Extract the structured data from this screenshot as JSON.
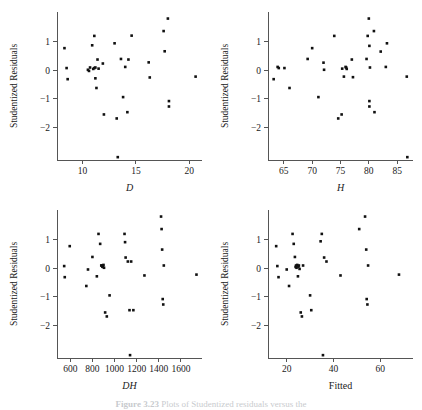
{
  "figure": {
    "width": 422,
    "height": 410,
    "background": "#ffffff",
    "point_color": "#111111",
    "axis_color": "#555555",
    "caption_label": "Figure 3.23",
    "caption_text": "Plots of Studentized residuals versus the"
  },
  "panels": [
    {
      "id": "panel-d",
      "xlabel": "D",
      "xlabel_style": "italic",
      "ylabel": "Studentized Residuals",
      "xticks": [
        10,
        15,
        20
      ],
      "yticks": [
        1,
        0,
        -1,
        -2
      ],
      "ytick_labels": [
        "1",
        "0",
        "−1",
        "−2"
      ],
      "xlim": [
        7.6,
        21.2
      ],
      "ylim": [
        -3.15,
        2.05
      ]
    },
    {
      "id": "panel-h",
      "xlabel": "H",
      "xlabel_style": "italic",
      "ylabel": "Studentized Residuals",
      "xticks": [
        65,
        70,
        75,
        80,
        85
      ],
      "yticks": [
        1,
        0,
        -1,
        -2
      ],
      "ytick_labels": [
        "1",
        "0",
        "−1",
        "−2"
      ],
      "xlim": [
        62.2,
        87.8
      ],
      "ylim": [
        -3.15,
        2.05
      ]
    },
    {
      "id": "panel-dh",
      "xlabel": "DH",
      "xlabel_style": "italic",
      "ylabel": "Studentized Residuals",
      "xticks": [
        600,
        800,
        1000,
        1200,
        1400,
        1600
      ],
      "yticks": [
        1,
        0,
        -1,
        -2
      ],
      "ytick_labels": [
        "1",
        "0",
        "−1",
        "−2"
      ],
      "xlim": [
        480,
        1790
      ],
      "ylim": [
        -3.15,
        2.05
      ]
    },
    {
      "id": "panel-fitted",
      "xlabel": "Fitted",
      "xlabel_style": "normal",
      "ylabel": "Studentized Residuals",
      "xticks": [
        20,
        40,
        60
      ],
      "yticks": [
        1,
        0,
        -1,
        -2
      ],
      "ytick_labels": [
        "1",
        "0",
        "−1",
        "−2"
      ],
      "xlim": [
        12,
        74
      ],
      "ylim": [
        -3.15,
        2.05
      ]
    }
  ],
  "chart_data": [
    {
      "type": "scatter",
      "title": "",
      "xlabel": "D",
      "ylabel": "Studentized Residuals",
      "xlim": [
        7.6,
        21.2
      ],
      "ylim": [
        -3.15,
        2.05
      ],
      "grid": false,
      "legend": "none",
      "x": [
        8.3,
        8.5,
        8.6,
        10.5,
        10.6,
        10.7,
        10.9,
        11.0,
        11.1,
        11.1,
        11.2,
        11.2,
        11.3,
        11.4,
        11.5,
        11.9,
        12.0,
        13.0,
        13.2,
        13.3,
        13.6,
        13.8,
        14.0,
        14.2,
        14.3,
        14.6,
        16.2,
        16.3,
        17.6,
        17.7,
        18.0,
        18.1,
        18.1,
        20.6
      ],
      "y": [
        0.78,
        0.08,
        -0.31,
        0.02,
        -0.02,
        0.1,
        0.88,
        0.05,
        1.21,
        0.08,
        0.1,
        -0.28,
        -0.62,
        0.38,
        0.06,
        0.24,
        -1.55,
        0.95,
        -1.69,
        -3.05,
        0.4,
        -0.94,
        0.12,
        -1.47,
        0.38,
        1.22,
        0.28,
        -0.25,
        1.38,
        0.67,
        1.82,
        -1.08,
        -1.27,
        -0.22
      ]
    },
    {
      "type": "scatter",
      "title": "",
      "xlabel": "H",
      "ylabel": "Studentized Residuals",
      "xlim": [
        62.2,
        87.8
      ],
      "ylim": [
        -3.15,
        2.05
      ],
      "grid": false,
      "legend": "none",
      "x": [
        63.2,
        63.9,
        64.1,
        65.1,
        66.0,
        69.2,
        70.0,
        71.1,
        72.0,
        72.1,
        73.9,
        74.6,
        75.2,
        75.3,
        75.6,
        75.9,
        76.0,
        76.1,
        77.0,
        77.2,
        79.6,
        79.8,
        80.0,
        80.1,
        80.1,
        80.1,
        80.2,
        80.9,
        81.0,
        82.1,
        83.0,
        83.2,
        86.7,
        86.8
      ],
      "y": [
        -0.31,
        0.12,
        0.08,
        0.08,
        -0.62,
        0.4,
        0.78,
        -0.94,
        0.27,
        0.02,
        1.21,
        -1.69,
        -1.55,
        0.06,
        -0.22,
        0.12,
        0.1,
        0.05,
        0.38,
        -0.24,
        0.4,
        1.21,
        1.82,
        0.86,
        -1.08,
        -1.27,
        0.1,
        1.38,
        -1.47,
        0.66,
        0.12,
        0.95,
        -0.22,
        -3.05
      ]
    },
    {
      "type": "scatter",
      "title": "",
      "xlabel": "DH",
      "ylabel": "Studentized Residuals",
      "xlim": [
        480,
        1790
      ],
      "ylim": [
        -3.15,
        2.05
      ],
      "grid": false,
      "legend": "none",
      "x": [
        545,
        550,
        595,
        745,
        760,
        800,
        840,
        855,
        870,
        880,
        885,
        890,
        895,
        900,
        905,
        915,
        930,
        955,
        1090,
        1095,
        1100,
        1120,
        1135,
        1140,
        1150,
        1170,
        1270,
        1420,
        1425,
        1430,
        1435,
        1440,
        1445,
        1740
      ],
      "y": [
        0.08,
        -0.31,
        0.78,
        -0.62,
        -0.04,
        0.4,
        -0.28,
        1.21,
        0.86,
        0.1,
        0.1,
        0.06,
        0.05,
        0.12,
        0.02,
        -1.55,
        -1.69,
        -0.95,
        1.21,
        0.92,
        0.38,
        0.24,
        -1.47,
        -3.05,
        0.24,
        -1.47,
        -0.25,
        1.82,
        1.38,
        0.66,
        -1.08,
        -1.27,
        0.1,
        -0.22
      ]
    },
    {
      "type": "scatter",
      "title": "",
      "xlabel": "Fitted",
      "ylabel": "Studentized Residuals",
      "xlim": [
        12,
        74
      ],
      "ylim": [
        -3.15,
        2.05
      ],
      "grid": false,
      "legend": "none",
      "x": [
        15.5,
        16.0,
        16.5,
        20.0,
        21.0,
        22.5,
        23.0,
        23.5,
        23.8,
        24.0,
        24.2,
        24.5,
        24.8,
        25.0,
        25.2,
        25.5,
        26.0,
        26.5,
        27.0,
        30.0,
        30.5,
        34.5,
        35.0,
        35.5,
        36.0,
        37.0,
        43.0,
        51.0,
        53.5,
        54.0,
        54.2,
        54.5,
        54.8,
        68.0
      ],
      "y": [
        0.78,
        0.08,
        -0.31,
        -0.04,
        -0.62,
        1.21,
        0.86,
        0.4,
        0.05,
        0.1,
        0.02,
        0.12,
        -0.28,
        0.06,
        0.1,
        -0.02,
        -1.55,
        -1.69,
        0.1,
        -0.95,
        -1.47,
        0.95,
        1.21,
        -3.05,
        0.38,
        0.24,
        -0.25,
        1.38,
        1.82,
        0.66,
        -1.08,
        -1.27,
        0.1,
        -0.22
      ]
    }
  ]
}
